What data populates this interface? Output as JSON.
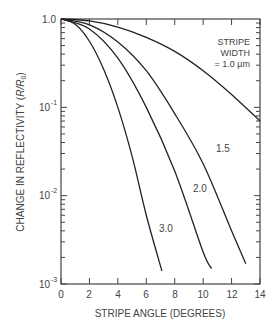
{
  "chart_data": {
    "type": "line",
    "title": "",
    "xlabel": "STRIPE ANGLE (DEGREES)",
    "ylabel": "CHANGE IN REFLECTIVITY (R/R0)",
    "xlim": [
      0,
      14
    ],
    "ylim": [
      0.001,
      1.0
    ],
    "yscale": "log",
    "grid": false,
    "x_ticks": [
      "0",
      "2",
      "4",
      "6",
      "8",
      "10",
      "12",
      "14"
    ],
    "y_ticks": [
      "1.0",
      "10^-1",
      "10^-2",
      "10^-3"
    ],
    "legend_title": [
      "STRIPE",
      "WIDTH"
    ],
    "series": [
      {
        "name": "1.0 µm",
        "label": "= 1.0 µm",
        "x": [
          0,
          2,
          4,
          6,
          8,
          10,
          12,
          14
        ],
        "values": [
          1.0,
          0.95,
          0.81,
          0.62,
          0.43,
          0.26,
          0.14,
          0.07
        ]
      },
      {
        "name": "1.5",
        "label": "1.5",
        "x": [
          0,
          2,
          4,
          6,
          8,
          10,
          12,
          13
        ],
        "values": [
          1.0,
          0.86,
          0.55,
          0.26,
          0.085,
          0.023,
          0.004,
          0.0017
        ]
      },
      {
        "name": "2.0",
        "label": "2.0",
        "x": [
          0,
          2,
          4,
          6,
          8,
          10,
          10.6
        ],
        "values": [
          1.0,
          0.77,
          0.36,
          0.1,
          0.019,
          0.0023,
          0.0015
        ]
      },
      {
        "name": "3.0",
        "label": "3.0",
        "x": [
          0,
          1,
          2,
          3,
          4,
          5,
          6,
          7.1
        ],
        "values": [
          1.0,
          0.87,
          0.56,
          0.27,
          0.1,
          0.028,
          0.006,
          0.0014
        ]
      }
    ]
  },
  "labels": {
    "y_top": "1.0",
    "y_1": "10",
    "y_1_exp": "-1",
    "y_2": "10",
    "y_2_exp": "-2",
    "y_3": "10",
    "y_3_exp": "-3",
    "xlabel": "STRIPE ANGLE (DEGREES)",
    "ylabel_main": "CHANGE IN REFLECTIVITY (",
    "ylabel_r": "R/R",
    "ylabel_sub": "0",
    "ylabel_end": ")",
    "legend_line1": "STRIPE",
    "legend_line2": "WIDTH",
    "legend_line3": "= 1.0 µm",
    "s15": "1.5",
    "s20": "2.0",
    "s30": "3.0",
    "x0": "0",
    "x2": "2",
    "x4": "4",
    "x6": "6",
    "x8": "8",
    "x10": "10",
    "x12": "12",
    "x14": "14"
  }
}
